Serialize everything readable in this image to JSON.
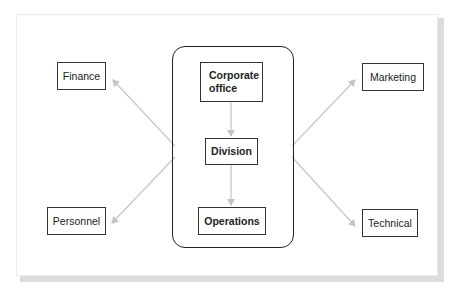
{
  "diagram": {
    "type": "organizational-structure",
    "central_group": {
      "nodes": [
        {
          "id": "corporate-office",
          "label_line1": "Corporate",
          "label_line2": "office"
        },
        {
          "id": "division",
          "label": "Division"
        },
        {
          "id": "operations",
          "label": "Operations"
        }
      ],
      "edges": [
        {
          "from": "corporate-office",
          "to": "division"
        },
        {
          "from": "division",
          "to": "operations"
        }
      ]
    },
    "functional_units": [
      {
        "id": "finance",
        "label": "Finance",
        "position": "top-left"
      },
      {
        "id": "personnel",
        "label": "Personnel",
        "position": "bottom-left"
      },
      {
        "id": "marketing",
        "label": "Marketing",
        "position": "top-right"
      },
      {
        "id": "technical",
        "label": "Technical",
        "position": "bottom-right"
      }
    ],
    "edges_out": [
      {
        "from": "central-group",
        "to": "finance"
      },
      {
        "from": "central-group",
        "to": "personnel"
      },
      {
        "from": "central-group",
        "to": "marketing"
      },
      {
        "from": "central-group",
        "to": "technical"
      }
    ],
    "colors": {
      "box_border": "#333333",
      "container_border": "#222222",
      "arrow": "#c8c8c8",
      "frame_shadow": "#dcdcdc"
    }
  }
}
